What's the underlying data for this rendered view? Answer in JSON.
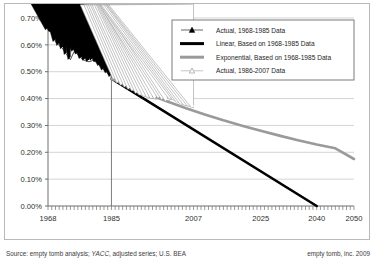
{
  "chart_data": {
    "type": "line",
    "title": "",
    "xlabel": "",
    "ylabel": "",
    "xlim": [
      1968,
      2050
    ],
    "ylim": [
      0.0,
      0.7
    ],
    "grid": true,
    "legend_position": "top-right",
    "y_ticks": [
      "0.00%",
      "0.10%",
      "0.20%",
      "0.30%",
      "0.40%",
      "0.50%",
      "0.60%",
      "0.70%"
    ],
    "y_tick_values": [
      0.0,
      0.1,
      0.2,
      0.3,
      0.4,
      0.5,
      0.6,
      0.7
    ],
    "x_ticks": [
      "1968",
      "1985",
      "2007",
      "2025",
      "2040",
      "2050"
    ],
    "x_tick_values": [
      1968,
      1985,
      2007,
      2025,
      2040,
      2050
    ],
    "marker_line_year": 1985,
    "series": [
      {
        "name": "Actual, 1968-1985 Data",
        "style": "marker-line",
        "marker": "filled-triangle",
        "color": "#000000",
        "x": [
          1968,
          1969,
          1970,
          1971,
          1972,
          1973,
          1974,
          1975,
          1976,
          1977,
          1978,
          1979,
          1980,
          1981,
          1982,
          1983,
          1984,
          1985
        ],
        "values": [
          0.655,
          0.648,
          0.612,
          0.597,
          0.585,
          0.563,
          0.545,
          0.575,
          0.565,
          0.548,
          0.541,
          0.537,
          0.542,
          0.536,
          0.522,
          0.505,
          0.495,
          0.481
        ]
      },
      {
        "name": "Linear, Based on 1968-1985 Data",
        "style": "line",
        "color": "#000000",
        "width": 2.6,
        "x": [
          1985,
          2040
        ],
        "values": [
          0.474,
          0.0
        ]
      },
      {
        "name": "Exponential, Based on 1968-1985 Data",
        "style": "line",
        "color": "#9a9a9a",
        "width": 2.6,
        "x": [
          1985,
          1990,
          1995,
          2000,
          2005,
          2010,
          2015,
          2020,
          2025,
          2030,
          2035,
          2040,
          2045,
          2050
        ],
        "values": [
          0.474,
          0.444,
          0.416,
          0.389,
          0.364,
          0.341,
          0.319,
          0.299,
          0.28,
          0.262,
          0.245,
          0.229,
          0.215,
          0.175
        ]
      },
      {
        "name": "Actual, 1986-2007 Data",
        "style": "marker-line",
        "marker": "hollow-triangle",
        "color": "#9a9a9a",
        "x": [
          1986,
          1987,
          1988,
          1989,
          1990,
          1991,
          1992,
          1993,
          1994,
          1995,
          1996,
          1997,
          1998,
          1999,
          2000,
          2001,
          2002,
          2003,
          2004,
          2005,
          2006,
          2007
        ],
        "values": [
          0.472,
          0.458,
          0.449,
          0.442,
          0.434,
          0.428,
          0.419,
          0.412,
          0.408,
          0.404,
          0.4,
          0.398,
          0.401,
          0.396,
          0.39,
          0.398,
          0.394,
          0.385,
          0.378,
          0.374,
          0.371,
          0.366
        ]
      }
    ]
  },
  "legend": {
    "items": [
      {
        "label": "Actual, 1968-1985 Data",
        "symbol": "filled-triangle",
        "color": "#000000"
      },
      {
        "label": "Linear, Based on 1968-1985 Data",
        "symbol": "thick-line",
        "color": "#000000"
      },
      {
        "label": "Exponential, Based on 1968-1985 Data",
        "symbol": "thick-line",
        "color": "#9a9a9a"
      },
      {
        "label": "Actual, 1986-2007 Data",
        "symbol": "hollow-triangle",
        "color": "#9a9a9a"
      }
    ]
  },
  "footer": {
    "source_prefix": "Source: empty tomb analysis; ",
    "source_italic": "YACC",
    "source_suffix": ", adjusted series; U.S. BEA",
    "credit": "empty tomb, inc.  2009"
  },
  "colors": {
    "axis": "#6e6e6e",
    "grid": "#c9c9c9",
    "frame": "#b9b9b9",
    "series_dark": "#000000",
    "series_gray": "#9a9a9a",
    "text": "#2e2e2e"
  }
}
